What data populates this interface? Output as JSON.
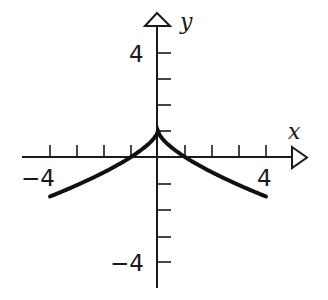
{
  "chart_data": {
    "type": "line",
    "title": "",
    "xlabel": "x",
    "ylabel": "y",
    "xlim": [
      -5,
      5.5
    ],
    "ylim": [
      -5,
      5
    ],
    "x_ticks": [
      -4,
      -3,
      -2,
      -1,
      1,
      2,
      3,
      4
    ],
    "y_ticks": [
      -4,
      -3,
      -2,
      -1,
      1,
      2,
      3,
      4
    ],
    "x_tick_labels": [
      {
        "value": -4,
        "label": "−4"
      },
      {
        "value": 4,
        "label": "4"
      }
    ],
    "y_tick_labels": [
      {
        "value": 4,
        "label": "4"
      },
      {
        "value": -4,
        "label": "−4"
      }
    ],
    "grid": false,
    "legend": null,
    "series": [
      {
        "name": "f(x)",
        "description": "cusp at (0,1), symmetric, decreasing away from origin; consistent with y = 1 - |x|^(2/3)",
        "x": [
          -4,
          -3,
          -2,
          -1,
          -0.5,
          0,
          0.5,
          1,
          2,
          3,
          4
        ],
        "y": [
          -1.52,
          -1.08,
          -0.59,
          0,
          0.37,
          1,
          0.37,
          0,
          -0.59,
          -1.08,
          -1.52
        ]
      }
    ],
    "key_points": {
      "cusp": [
        0,
        1
      ],
      "x_intercepts": [
        -1,
        1
      ],
      "left_endpoint": [
        -4,
        -1.5
      ],
      "right_endpoint": [
        4,
        -1.5
      ]
    }
  },
  "labels": {
    "x_axis": "x",
    "y_axis": "y",
    "x_neg4": "−4",
    "x_pos4": "4",
    "y_pos4": "4",
    "y_neg4": "−4"
  },
  "colors": {
    "axis": "#1a1a1a",
    "curve": "#111111",
    "background": "#ffffff"
  }
}
